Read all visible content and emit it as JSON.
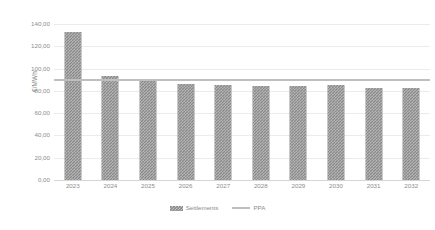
{
  "chart_data": {
    "type": "bar",
    "title": "",
    "xlabel": "",
    "ylabel": "€/MWh",
    "ylim": [
      0,
      140
    ],
    "ytick_step": 20,
    "ytick_labels": [
      "140,00",
      "120,00",
      "100,00",
      "80,00",
      "60,00",
      "40,00",
      "20,00",
      "0,00"
    ],
    "ytick_values": [
      140,
      120,
      100,
      80,
      60,
      40,
      20,
      0
    ],
    "categories": [
      "2023",
      "2024",
      "2025",
      "2026",
      "2027",
      "2028",
      "2029",
      "2030",
      "2031",
      "2032"
    ],
    "grid": true,
    "grid_axis": "y",
    "legend_position": "bottom-center",
    "series": [
      {
        "name": "Settlements",
        "kind": "bar",
        "color": "#8a8a8a",
        "pattern": "checkered",
        "values": [
          133.0,
          93.0,
          90.0,
          86.0,
          85.0,
          84.0,
          84.0,
          85.0,
          83.0,
          83.0
        ]
      },
      {
        "name": "PPA",
        "kind": "line",
        "color": "#bfbfbf",
        "constant_value": 90.0,
        "values": [
          90.0,
          90.0,
          90.0,
          90.0,
          90.0,
          90.0,
          90.0,
          90.0,
          90.0,
          90.0
        ]
      }
    ]
  },
  "legend": {
    "items": [
      {
        "label": "Settlements",
        "swatch": "bar-pattern-swatch"
      },
      {
        "label": "PPA",
        "swatch": "line-swatch"
      }
    ]
  },
  "colors": {
    "bar": "#8a8a8a",
    "line": "#bfbfbf",
    "gridline": "#eceaea",
    "baseline": "#d6d4d4",
    "text": "#8c8c8c",
    "background": "#ffffff"
  }
}
